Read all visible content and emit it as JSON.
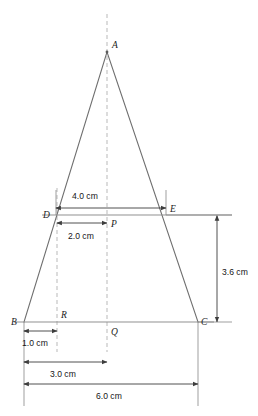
{
  "figure": {
    "type": "geometry-diagram",
    "shape": "isosceles-triangle-with-midline",
    "vertices": {
      "A": {
        "label": "A",
        "x": 107,
        "y": 52
      },
      "B": {
        "label": "B",
        "x": 24,
        "y": 322
      },
      "C": {
        "label": "C",
        "x": 198,
        "y": 322
      },
      "D": {
        "label": "D",
        "x": 56,
        "y": 215
      },
      "E": {
        "label": "E",
        "x": 166,
        "y": 215
      },
      "P": {
        "label": "P",
        "x": 107,
        "y": 215
      },
      "Q": {
        "label": "Q",
        "x": 107,
        "y": 322
      },
      "R": {
        "label": "R",
        "x": 57,
        "y": 322
      }
    },
    "point_labels": [
      {
        "name": "A",
        "text": "A",
        "x": 112,
        "y": 48
      },
      {
        "name": "B",
        "text": "B",
        "x": 11,
        "y": 325
      },
      {
        "name": "C",
        "text": "C",
        "x": 201,
        "y": 325
      },
      {
        "name": "D",
        "text": "D",
        "x": 43,
        "y": 218
      },
      {
        "name": "E",
        "text": "E",
        "x": 170,
        "y": 212
      },
      {
        "name": "P",
        "text": "P",
        "x": 111,
        "y": 227
      },
      {
        "name": "Q",
        "text": "Q",
        "x": 111,
        "y": 335
      },
      {
        "name": "R",
        "text": "R",
        "x": 61,
        "y": 318
      }
    ],
    "dimensions": [
      {
        "name": "de-width",
        "label": "4.0 cm",
        "orientation": "horizontal",
        "value": 4.0,
        "unit": "cm",
        "from_point": "D",
        "to_point": "E",
        "x1": 56,
        "x2": 166,
        "y": 208,
        "label_x": 72,
        "label_y": 199
      },
      {
        "name": "dp-half-width",
        "label": "2.0 cm",
        "orientation": "horizontal",
        "value": 2.0,
        "unit": "cm",
        "from_point": "D",
        "to_point": "P",
        "x1": 57,
        "x2": 107,
        "y": 223,
        "label_x": 68,
        "label_y": 239
      },
      {
        "name": "br-offset",
        "label": "1.0 cm",
        "orientation": "horizontal",
        "value": 1.0,
        "unit": "cm",
        "from_point": "B",
        "to_point": "R",
        "x1": 24,
        "x2": 57,
        "y": 331,
        "label_x": 22,
        "label_y": 346
      },
      {
        "name": "bq-half-base",
        "label": "3.0 cm",
        "orientation": "horizontal",
        "value": 3.0,
        "unit": "cm",
        "from_point": "B",
        "to_point": "Q",
        "x1": 24,
        "x2": 107,
        "y": 362,
        "label_x": 50,
        "label_y": 377
      },
      {
        "name": "bc-base",
        "label": "6.0 cm",
        "orientation": "horizontal",
        "value": 6.0,
        "unit": "cm",
        "from_point": "B",
        "to_point": "C",
        "x1": 24,
        "x2": 198,
        "y": 384,
        "label_x": 96,
        "label_y": 399
      },
      {
        "name": "de-to-bc-height",
        "label": "3.6 cm",
        "orientation": "vertical",
        "value": 3.6,
        "unit": "cm",
        "from_point": "E",
        "to_point": "C",
        "x": 217,
        "y1": 216,
        "y2": 322,
        "label_x": 222,
        "label_y": 272
      }
    ],
    "axes": [
      {
        "name": "axis-of-symmetry",
        "x": 107,
        "y1": 14,
        "y2": 352,
        "style": "dashed"
      },
      {
        "name": "guide-line-through-R",
        "x": 57,
        "y1": 188,
        "y2": 352,
        "style": "dashed"
      }
    ],
    "extension_lines": [
      {
        "name": "ext-left-vertical",
        "x1": 24,
        "y1": 322,
        "x2": 24,
        "y2": 406
      },
      {
        "name": "ext-right-vertical",
        "x1": 198,
        "y1": 322,
        "x2": 198,
        "y2": 406
      },
      {
        "name": "ext-D-up",
        "x1": 56,
        "y1": 215,
        "x2": 56,
        "y2": 190
      },
      {
        "name": "ext-E-up",
        "x1": 166,
        "y1": 215,
        "x2": 166,
        "y2": 190
      },
      {
        "name": "ext-E-right",
        "x1": 166,
        "y1": 215,
        "x2": 232,
        "y2": 215
      },
      {
        "name": "ext-C-right",
        "x1": 198,
        "y1": 322,
        "x2": 232,
        "y2": 322
      }
    ],
    "segments": [
      {
        "name": "segment-DE",
        "from": "D",
        "to": "E"
      },
      {
        "name": "segment-BC",
        "from": "B",
        "to": "C"
      }
    ],
    "colors": {
      "edge": "#6f6f6f",
      "segment": "#8a8a8a",
      "dashed_axis": "#b9b9b9",
      "dimension": "#3d3d3d",
      "label": "#1b1b1b",
      "background": "#ffffff"
    }
  }
}
